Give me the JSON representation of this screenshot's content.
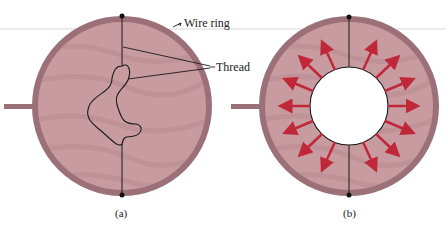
{
  "figure": {
    "labels": {
      "wire_ring": "Wire ring",
      "thread": "Thread"
    },
    "captions": {
      "a": "(a)",
      "b": "(b)"
    },
    "colors": {
      "film": "#c99ba0",
      "film_streak": "#b88c92",
      "ring": "#9c7078",
      "thread": "#1a1a1a",
      "arrow": "#c0283a",
      "hole": "#ffffff",
      "guide_line": "#d6d6d6"
    },
    "panels": [
      {
        "id": "a",
        "description": "Soap film in wire ring with loose thread loop"
      },
      {
        "id": "b",
        "description": "Film inside loop punctured; thread pulled into circle by surface tension (arrows outward)"
      }
    ],
    "arrow_count": 16
  }
}
